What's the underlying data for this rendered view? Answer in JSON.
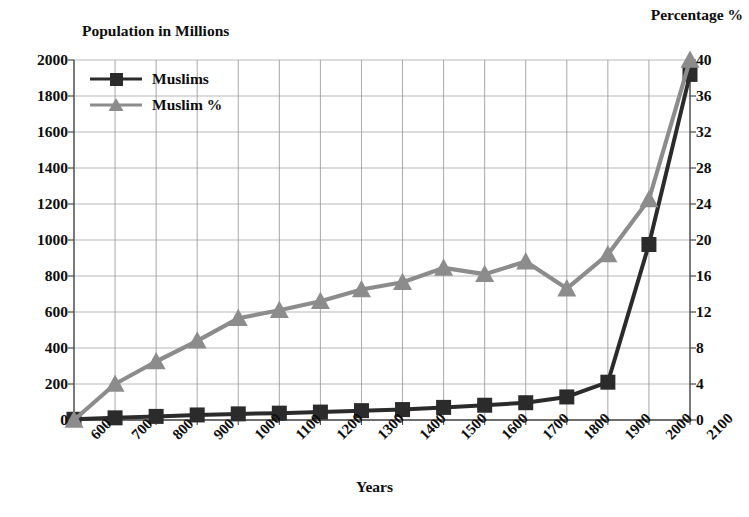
{
  "chart_data": {
    "type": "line",
    "title": "",
    "xlabel": "Years",
    "ylabel": "Population in Millions",
    "y2label": "Percentage %",
    "grid": true,
    "legend_position": "top-left",
    "categories": [
      600,
      700,
      800,
      900,
      1000,
      1100,
      1200,
      1300,
      1400,
      1500,
      1600,
      1700,
      1800,
      1900,
      2000,
      2100
    ],
    "x_tick_labels": [
      "600",
      "700",
      "800",
      "900",
      "1000",
      "1100",
      "1200",
      "1300",
      "1400",
      "1500",
      "1600",
      "1700",
      "1800",
      "1900",
      "2000",
      "2100"
    ],
    "ylim": [
      0,
      2000
    ],
    "y_tick_labels": [
      "0",
      "200",
      "400",
      "600",
      "800",
      "1000",
      "1200",
      "1400",
      "1600",
      "1800",
      "2000"
    ],
    "y_ticks": [
      0,
      200,
      400,
      600,
      800,
      1000,
      1200,
      1400,
      1600,
      1800,
      2000
    ],
    "y2lim": [
      0,
      40
    ],
    "y2_tick_labels": [
      "0",
      "4",
      "8",
      "12",
      "16",
      "20",
      "24",
      "28",
      "32",
      "36",
      "40"
    ],
    "y2_ticks": [
      0,
      4,
      8,
      12,
      16,
      20,
      24,
      28,
      32,
      36,
      40
    ],
    "series": [
      {
        "name": "Muslims",
        "axis": "left",
        "color": "#2b2b2b",
        "marker": "square",
        "values": [
          4,
          12,
          20,
          28,
          34,
          38,
          44,
          52,
          58,
          70,
          82,
          96,
          128,
          210,
          975,
          1920
        ]
      },
      {
        "name": "Muslim %",
        "axis": "right",
        "color": "#8c8c8c",
        "marker": "triangle",
        "values": [
          0,
          4.0,
          6.5,
          8.8,
          11.3,
          12.2,
          13.2,
          14.5,
          15.3,
          16.9,
          16.2,
          17.6,
          14.6,
          18.4,
          24.5,
          40.0
        ]
      }
    ],
    "legend": [
      {
        "label": "Muslims",
        "color": "#2b2b2b",
        "marker": "square"
      },
      {
        "label": "Muslim %",
        "color": "#8c8c8c",
        "marker": "triangle"
      }
    ],
    "colors": {
      "series_muslims": "#2b2b2b",
      "series_muslim_pct": "#8c8c8c",
      "grid": "#9a9a9a",
      "axis": "#4a4a4a",
      "text": "#0d0d0d",
      "background": "#ffffff"
    }
  }
}
